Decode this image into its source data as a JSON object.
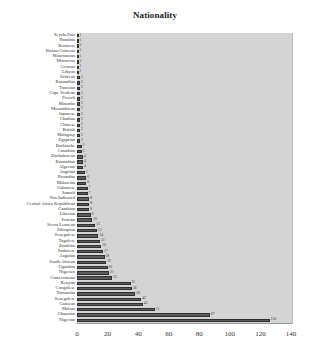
{
  "chart_data": {
    "type": "bar",
    "orientation": "horizontal",
    "title": "Nationality",
    "xlabel": "",
    "ylabel": "",
    "xlim": [
      0,
      140
    ],
    "x_ticks": [
      "0",
      "20",
      "40",
      "60",
      "80",
      "100",
      "120",
      "140"
    ],
    "grid": false,
    "legend": "none",
    "categories": [
      "Seychellois",
      "Namibia",
      "Beninese",
      "Bissau-Guinean",
      "Mauritanian",
      "Moroccan",
      "German",
      "Libyan",
      "Eritrean",
      "Burundian",
      "Tunisian",
      "Cape Verdean",
      "French",
      "Mosotho",
      "Mozambican",
      "Japanese",
      "Chadian",
      "Chinese",
      "British",
      "Malagasy",
      "Egyptian",
      "Burkinabe",
      "Canadian",
      "Zimbabwean",
      "Burundian",
      "Algerian",
      "Angolan",
      "Rwandan",
      "Malawian",
      "Gabonese",
      "Somali",
      "Not Indicated",
      "Central Africa Republican",
      "Gambian",
      "Liberian",
      "Ivorian",
      "Sierra Leonean",
      "Ethiopian",
      "Senegalese",
      "Togolese",
      "Zambian",
      "Sudanese",
      "Angolan",
      "South African",
      "Ugandan",
      "Nigerien",
      "Cameroonian",
      "Kenyan",
      "Congolese",
      "Tanzanian",
      "Senegalese",
      "Guinean",
      "Malian",
      "Ghanaian",
      "Nigerian"
    ],
    "values": [
      1,
      1,
      1,
      1,
      1,
      1,
      1,
      1,
      2,
      2,
      2,
      2,
      2,
      2,
      2,
      2,
      2,
      2,
      2,
      2,
      2,
      3,
      3,
      4,
      4,
      4,
      5,
      6,
      6,
      7,
      7,
      8,
      8,
      8,
      9,
      10,
      12,
      13,
      14,
      15,
      16,
      17,
      18,
      19,
      20,
      21,
      23,
      35,
      36,
      38,
      42,
      43,
      51,
      87,
      126
    ]
  },
  "axis": {
    "ticks": [
      {
        "label": "0",
        "value": 0
      },
      {
        "label": "20",
        "value": 20
      },
      {
        "label": "40",
        "value": 40
      },
      {
        "label": "60",
        "value": 60
      },
      {
        "label": "80",
        "value": 80
      },
      {
        "label": "100",
        "value": 100
      },
      {
        "label": "120",
        "value": 120
      },
      {
        "label": "140",
        "value": 140
      }
    ]
  },
  "colors": {
    "plot_background": "#d4d4d4",
    "bar_fill": "#5b5b5b",
    "bar_edge": "#2f2f2f"
  }
}
